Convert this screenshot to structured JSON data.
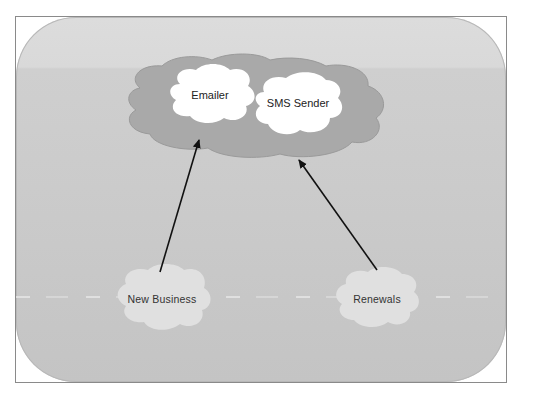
{
  "diagram": {
    "type": "cloud-architecture",
    "colors": {
      "frame_border": "#8a8a8a",
      "background": "#cacaca",
      "outer_cloud": "#a9a9a9",
      "inner_cloud": "#ffffff",
      "source_cloud": "#e2e2e2",
      "arrow": "#111111"
    },
    "outer_cloud": {
      "nodes": [
        {
          "id": "emailer",
          "label": "Emailer"
        },
        {
          "id": "sms_sender",
          "label": "SMS Sender"
        }
      ]
    },
    "sources": [
      {
        "id": "new_business",
        "label": "New Business"
      },
      {
        "id": "renewals",
        "label": "Renewals"
      }
    ],
    "edges": [
      {
        "from": "new_business",
        "to": "outer_cloud"
      },
      {
        "from": "renewals",
        "to": "outer_cloud"
      }
    ]
  }
}
